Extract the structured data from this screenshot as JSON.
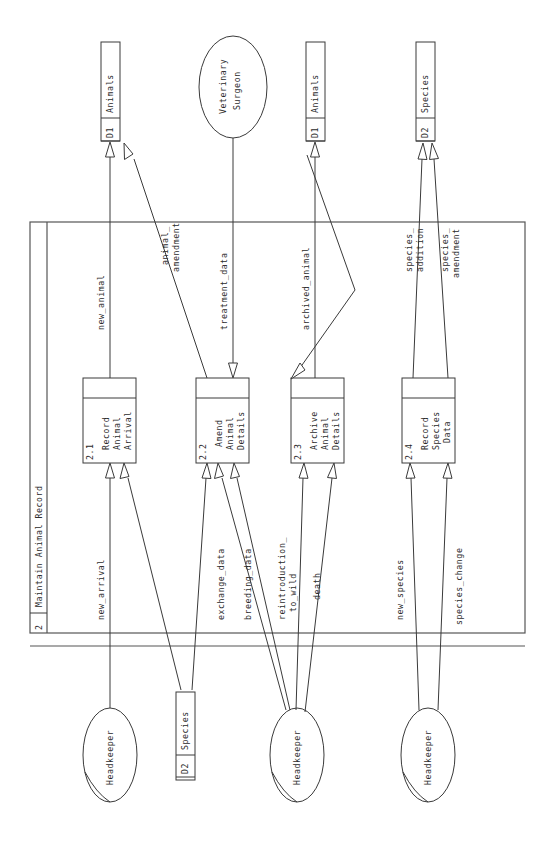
{
  "diagram": {
    "type": "data-flow-diagram",
    "orientation": "rotated-90-clockwise",
    "system_boundary": {
      "id": "2",
      "label": "Maintain Animal Record"
    },
    "datastores": [
      {
        "id": "D1",
        "label": "Animals",
        "position": "top-left"
      },
      {
        "id": "D1",
        "label": "Animals",
        "position": "top-center-right"
      },
      {
        "id": "D2",
        "label": "Species",
        "position": "top-right"
      },
      {
        "id": "D2",
        "label": "Species",
        "position": "bottom-left"
      }
    ],
    "entities": [
      {
        "label": "Veterinary Surgeon",
        "position": "top-center"
      },
      {
        "label": "Headkeeper",
        "position": "bottom-1"
      },
      {
        "label": "Headkeeper",
        "position": "bottom-2"
      },
      {
        "label": "Headkeeper",
        "position": "bottom-3"
      }
    ],
    "processes": [
      {
        "id": "2.1",
        "label": "Record Animal Arrival",
        "lines": [
          "Record",
          "Animal",
          "Arrival"
        ]
      },
      {
        "id": "2.2",
        "label": "Amend Animal Details",
        "lines": [
          "Amend",
          "Animal",
          "Details"
        ]
      },
      {
        "id": "2.3",
        "label": "Archive Animal Details",
        "lines": [
          "Archive",
          "Animal",
          "Details"
        ]
      },
      {
        "id": "2.4",
        "label": "Record Species Data",
        "lines": [
          "Record",
          "Species",
          "Data"
        ]
      }
    ],
    "flows": [
      {
        "label": "new_animal",
        "from": "2.1",
        "to": "D1 Animals"
      },
      {
        "label": "animal_amendment",
        "lines": [
          "animal_",
          "amendment"
        ],
        "from": "2.2",
        "to": "D1 Animals"
      },
      {
        "label": "treatment_data",
        "from": "Veterinary Surgeon",
        "to": "2.2"
      },
      {
        "label": "archived_animal",
        "from": "2.3",
        "to": "D1 Animals"
      },
      {
        "label": "species_addition",
        "lines": [
          "species_",
          "addition"
        ],
        "from": "2.4",
        "to": "D2 Species"
      },
      {
        "label": "species_amendment",
        "lines": [
          "species_",
          "amendment"
        ],
        "from": "2.4",
        "to": "D2 Species"
      },
      {
        "label": "new_arrival",
        "from": "Headkeeper",
        "to": "2.1"
      },
      {
        "label": "exchange_data",
        "from": "Headkeeper",
        "to": "2.2"
      },
      {
        "label": "breeding_data",
        "from": "Headkeeper",
        "to": "2.2"
      },
      {
        "label": "reintroduction_to_wild",
        "lines": [
          "reintroduction_",
          "to_wild"
        ],
        "from": "Headkeeper",
        "to": "2.3"
      },
      {
        "label": "death",
        "from": "Headkeeper",
        "to": "2.3"
      },
      {
        "label": "new_species",
        "from": "Headkeeper",
        "to": "2.4"
      },
      {
        "label": "species_change",
        "from": "Headkeeper",
        "to": "2.4"
      }
    ],
    "colors": {
      "stroke": "#3a3a3a",
      "text": "#2b2b2b",
      "background": "#ffffff"
    }
  }
}
